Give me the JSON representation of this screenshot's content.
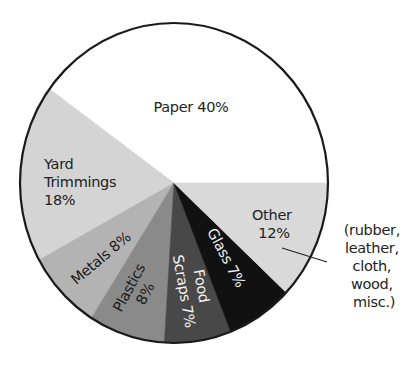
{
  "chart_data": {
    "type": "pie",
    "title": "",
    "start_angle_deg": 0,
    "direction": "counterclockwise",
    "slices": [
      {
        "name": "Paper",
        "value": 40,
        "label_lines": [
          "Paper 40%"
        ],
        "color": "#ffffff"
      },
      {
        "name": "Yard Trimmings",
        "value": 18,
        "label_lines": [
          "Yard",
          "Trimmings",
          "18%"
        ],
        "color": "#d4d4d4"
      },
      {
        "name": "Metals",
        "value": 8,
        "label_lines": [
          "Metals 8%"
        ],
        "color": "#b3b3b3"
      },
      {
        "name": "Plastics",
        "value": 8,
        "label_lines": [
          "Plastics",
          "8%"
        ],
        "color": "#8a8a8a"
      },
      {
        "name": "Food Scraps",
        "value": 7,
        "label_lines": [
          "Food",
          "Scraps 7%"
        ],
        "color": "#484848"
      },
      {
        "name": "Glass",
        "value": 7,
        "label_lines": [
          "Glass 7%"
        ],
        "color": "#111111"
      },
      {
        "name": "Other",
        "value": 12,
        "label_lines": [
          "Other",
          "12%"
        ],
        "color": "#d9d9d9"
      }
    ],
    "annotation": {
      "target": "Other",
      "lines": [
        "(rubber,",
        "leather,",
        "cloth,",
        "wood,",
        "misc.)"
      ]
    },
    "legend": "none"
  }
}
